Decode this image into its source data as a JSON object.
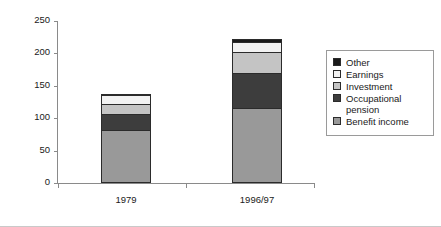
{
  "chart_data": {
    "type": "bar",
    "subtype": "stacked",
    "title": "",
    "xlabel": "",
    "ylabel": "£ per week (2000/01 prices)",
    "categories": [
      "1979",
      "1996/97"
    ],
    "ylim": [
      0,
      250
    ],
    "yticks": [
      0,
      50,
      100,
      150,
      200,
      250
    ],
    "ytick_labels": [
      "0",
      "50",
      "100",
      "150",
      "200",
      "250"
    ],
    "grid": false,
    "legend_position": "right",
    "series": [
      {
        "name": "Benefit income",
        "color": "#999999",
        "values": [
          82,
          116
        ]
      },
      {
        "name": "Occupational pension",
        "color": "#3d3d3d",
        "values": [
          25,
          54
        ]
      },
      {
        "name": "Investment",
        "color": "#c4c4c4",
        "values": [
          15,
          32
        ]
      },
      {
        "name": "Earnings",
        "color": "#f2f2f2",
        "values": [
          14,
          15
        ]
      },
      {
        "name": "Other",
        "color": "#1a1a1a",
        "values": [
          2,
          5
        ]
      }
    ],
    "totals": [
      138,
      222
    ],
    "stack_order_bottom_to_top": [
      "Benefit income",
      "Occupational pension",
      "Investment",
      "Earnings",
      "Other"
    ]
  },
  "legend": {
    "items": [
      {
        "label": "Other",
        "color": "#1a1a1a"
      },
      {
        "label": "Earnings",
        "color": "#f2f2f2"
      },
      {
        "label": "Investment",
        "color": "#c4c4c4"
      },
      {
        "label": "Occupational\npension",
        "color": "#3d3d3d"
      },
      {
        "label": "Benefit income",
        "color": "#999999"
      }
    ]
  }
}
